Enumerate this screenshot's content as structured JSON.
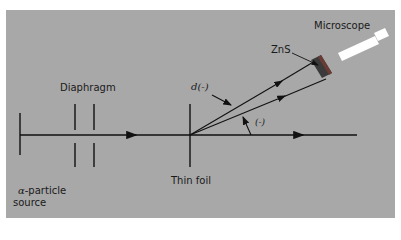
{
  "diagram": {
    "background_color": "#a8a8a8",
    "labels": {
      "source_symbol": "α",
      "source_line1": "-particle",
      "source_line2": "source",
      "diaphragm": "Diaphragm",
      "foil": "Thin foil",
      "distance": "d(-)",
      "angle": "(-)",
      "screen": "ZnS",
      "microscope": "Microscope"
    }
  }
}
